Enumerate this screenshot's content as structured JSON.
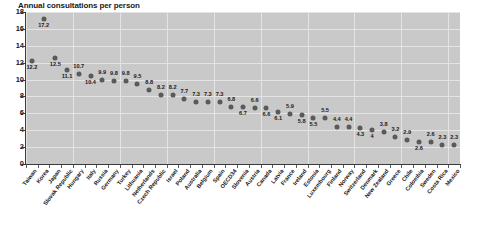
{
  "chart_data": {
    "type": "scatter",
    "title": "Annual consultations per person",
    "xlabel": "",
    "ylabel": "",
    "ylim": [
      0,
      18
    ],
    "ytick_labels": [
      "0",
      "2",
      "4",
      "6",
      "8",
      "10",
      "12",
      "14",
      "16",
      "18"
    ],
    "yticks": [
      0,
      2,
      4,
      6,
      8,
      10,
      12,
      14,
      16,
      18
    ],
    "grid": true,
    "legend": null,
    "marker_color": "#5a5a5a",
    "plot_background": "#c9c9c9",
    "gridline_color": "#e4e4e4",
    "categories": [
      "Taiwan",
      "Korea",
      "Japan",
      "Slovak Republic",
      "Hungary",
      "Italy",
      "Russia",
      "Germany",
      "Turkey",
      "Lithuania",
      "Netherlands",
      "Czech Republic",
      "Israel",
      "Poland",
      "Australia",
      "Belgium",
      "Spain",
      "OECD34",
      "Slovenia",
      "Austria",
      "Canada",
      "Latvia",
      "France",
      "Ireland",
      "Estonia",
      "Luxembourg",
      "Finland",
      "Norway",
      "Switzerland",
      "Denmark",
      "New Zealand",
      "Greece",
      "Chile",
      "Colombia",
      "Sweden",
      "Costa Rica",
      "Mexico"
    ],
    "values": [
      12.2,
      17.2,
      12.5,
      11.1,
      10.7,
      10.4,
      9.9,
      9.8,
      9.8,
      9.5,
      8.8,
      8.2,
      8.2,
      7.7,
      7.3,
      7.3,
      7.3,
      6.8,
      6.7,
      6.6,
      6.6,
      6.1,
      5.9,
      5.8,
      5.5,
      5.5,
      4.4,
      4.4,
      4.3,
      4,
      3.8,
      3.2,
      2.9,
      2.6,
      2.6,
      2.3,
      2.3
    ],
    "value_labels": [
      "12.2",
      "17.2",
      "12.5",
      "11.1",
      "10.7",
      "10.4",
      "9.9",
      "9.8",
      "9.8",
      "9.5",
      "8.8",
      "8.2",
      "8.2",
      "7.7",
      "7.3",
      "7.3",
      "7.3",
      "6.8",
      "6.7",
      "6.6",
      "6.6",
      "6.1",
      "5.9",
      "5.8",
      "5.5",
      "5.5",
      "4.4",
      "4.4",
      "4.3",
      "4",
      "3.8",
      "3.2",
      "2.9",
      "2.6",
      "2.6",
      "2.3",
      "2.3"
    ],
    "label_positions": [
      "below",
      "below",
      "below",
      "below",
      "above",
      "below",
      "above",
      "above",
      "above",
      "above",
      "above",
      "above",
      "above",
      "above",
      "above",
      "above",
      "above",
      "above",
      "below",
      "above",
      "below",
      "below",
      "above",
      "below",
      "below",
      "above",
      "above",
      "above",
      "below",
      "below",
      "above",
      "above",
      "above",
      "below",
      "above",
      "above",
      "above"
    ]
  }
}
